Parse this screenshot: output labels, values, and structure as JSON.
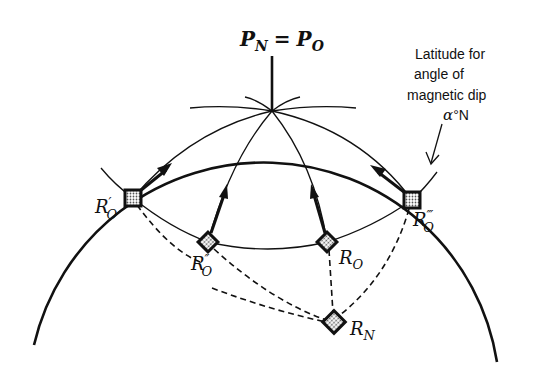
{
  "diagram": {
    "pole_label": {
      "main_left": "P",
      "sub_left": "N",
      "equals": "=",
      "main_right": "P",
      "sub_right": "O"
    },
    "annotation": {
      "lines": [
        "Latitude for",
        "angle of",
        "magnetic dip"
      ],
      "value_symbol": "α",
      "value_suffix": "°N"
    },
    "stations": [
      {
        "id": "R_O_prime",
        "main": "R",
        "prime": "′",
        "sub": "O"
      },
      {
        "id": "R_O_double_prime",
        "main": "R",
        "prime": "″",
        "sub": "O"
      },
      {
        "id": "R_O",
        "main": "R",
        "prime": "",
        "sub": "O"
      },
      {
        "id": "R_O_triple_prime",
        "main": "R",
        "prime": "‴",
        "sub": "O"
      },
      {
        "id": "R_N",
        "main": "R",
        "prime": "",
        "sub": "N"
      }
    ],
    "colors": {
      "ink": "#111111",
      "background": "#ffffff",
      "fill_pattern": "#bbbbbb"
    }
  }
}
